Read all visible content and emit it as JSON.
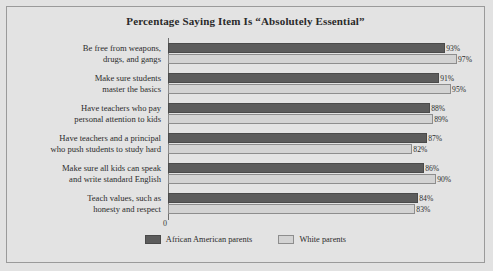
{
  "chart_data": {
    "type": "bar",
    "orientation": "horizontal",
    "title": "Percentage Saying Item Is “Absolutely Essential”",
    "xlabel": "",
    "ylabel": "",
    "xlim": [
      0,
      100
    ],
    "grid": false,
    "legend_position": "bottom",
    "axis_ticks": [
      "0"
    ],
    "categories": [
      "Be free from weapons,\ndrugs, and gangs",
      "Make sure students\nmaster the basics",
      "Have teachers who pay\npersonal attention to kids",
      "Have teachers and a principal\nwho push students to study hard",
      "Make sure all kids can speak\nand write standard English",
      "Teach values, such as\nhonesty and respect"
    ],
    "category_lines": [
      [
        "Be free from weapons,",
        "drugs, and gangs"
      ],
      [
        "Make sure students",
        "master the basics"
      ],
      [
        "Have teachers who pay",
        "personal attention to kids"
      ],
      [
        "Have teachers and a principal",
        "who push students to study hard"
      ],
      [
        "Make sure all kids can speak",
        "and write standard English"
      ],
      [
        "Teach values, such as",
        "honesty and respect"
      ]
    ],
    "series": [
      {
        "name": "African American parents",
        "color": "#5c5c5c",
        "values": [
          93,
          91,
          88,
          87,
          86,
          84
        ],
        "labels": [
          "93%",
          "91%",
          "88%",
          "87%",
          "86%",
          "84%"
        ]
      },
      {
        "name": "White parents",
        "color": "#d3d3d3",
        "values": [
          97,
          95,
          89,
          82,
          90,
          83
        ],
        "labels": [
          "97%",
          "95%",
          "89%",
          "82%",
          "90%",
          "83%"
        ]
      }
    ]
  },
  "colors": {
    "background": "#e3e3e3",
    "frame": "#9a9a9a",
    "axis": "#6e6e6e",
    "series_dark": "#5c5c5c",
    "series_light": "#d3d3d3",
    "text": "#2c2c2c"
  }
}
